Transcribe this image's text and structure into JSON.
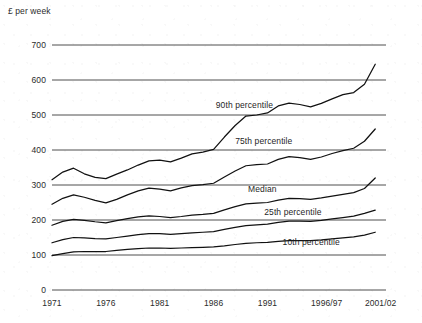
{
  "chart_data": {
    "type": "line",
    "title": "",
    "subtitle": "",
    "xlabel": "",
    "ylabel": "£ per week",
    "ylim": [
      0,
      700
    ],
    "xlim": [
      1971,
      2002
    ],
    "grid": true,
    "legend_position": "inline-labels",
    "y_ticks": [
      "0",
      "100",
      "200",
      "300",
      "400",
      "500",
      "600",
      "700"
    ],
    "y_tick_values": [
      0,
      100,
      200,
      300,
      400,
      500,
      600,
      700
    ],
    "x_ticks": [
      "1971",
      "1976",
      "1981",
      "1986",
      "1991",
      "1996/97",
      "2001/02"
    ],
    "x_tick_values": [
      1971,
      1976,
      1981,
      1986,
      1991,
      1996.5,
      2001.5
    ],
    "x": [
      1971,
      1972,
      1973,
      1974,
      1975,
      1976,
      1977,
      1978,
      1979,
      1980,
      1981,
      1982,
      1983,
      1984,
      1985,
      1986,
      1987,
      1988,
      1989,
      1990,
      1991,
      1992,
      1993,
      1994,
      1995,
      1996,
      1997,
      1998,
      1999,
      2000,
      2001
    ],
    "series": [
      {
        "name": "90th percentile",
        "label": "90th percentile",
        "label_x": 1986.2,
        "label_y": 528,
        "values": [
          315,
          337,
          348,
          332,
          322,
          318,
          331,
          343,
          357,
          369,
          371,
          366,
          377,
          389,
          394,
          402,
          437,
          470,
          497,
          500,
          506,
          526,
          534,
          530,
          523,
          533,
          546,
          558,
          564,
          588,
          645
        ]
      },
      {
        "name": "75th percentile",
        "label": "75th percentile",
        "label_x": 1988.0,
        "label_y": 427,
        "values": [
          245,
          262,
          272,
          265,
          256,
          249,
          259,
          272,
          283,
          291,
          288,
          283,
          292,
          298,
          301,
          305,
          323,
          340,
          355,
          358,
          360,
          373,
          381,
          378,
          373,
          380,
          390,
          398,
          405,
          425,
          460
        ]
      },
      {
        "name": "Median",
        "label": "Median",
        "label_x": 1989.2,
        "label_y": 288,
        "values": [
          185,
          196,
          202,
          199,
          195,
          192,
          198,
          204,
          209,
          212,
          210,
          207,
          210,
          214,
          216,
          219,
          229,
          238,
          246,
          248,
          250,
          257,
          262,
          261,
          259,
          263,
          268,
          273,
          278,
          290,
          320
        ]
      },
      {
        "name": "25th percentile",
        "label": "25th percentile",
        "label_x": 1990.7,
        "label_y": 224,
        "values": [
          135,
          144,
          150,
          149,
          147,
          146,
          150,
          154,
          158,
          161,
          161,
          159,
          161,
          163,
          165,
          167,
          173,
          179,
          184,
          186,
          188,
          193,
          197,
          197,
          196,
          199,
          203,
          207,
          211,
          219,
          228
        ]
      },
      {
        "name": "10th percentile",
        "label": "10th percentile",
        "label_x": 1992.4,
        "label_y": 136,
        "values": [
          98,
          104,
          109,
          110,
          110,
          110,
          113,
          116,
          118,
          120,
          120,
          119,
          120,
          121,
          122,
          123,
          126,
          130,
          133,
          135,
          136,
          139,
          141,
          141,
          141,
          143,
          146,
          149,
          152,
          157,
          165
        ]
      }
    ]
  }
}
